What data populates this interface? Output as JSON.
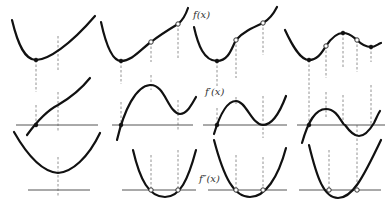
{
  "labels": {
    "f": "f(x)",
    "f1": "f′(x)",
    "f2": "f″(x)"
  },
  "label_positions": {
    "f": {
      "x": 193,
      "y": 18
    },
    "f1": {
      "x": 205,
      "y": 95
    },
    "f2": {
      "x": 199,
      "y": 182
    }
  },
  "colors": {
    "curve": "#111111",
    "axis": "#555555",
    "dash": "#777777"
  },
  "panels": [
    {
      "id": "col1",
      "f": {
        "path": "M12,20 C18,45 25,60 36,60 C48,60 70,45 95,16",
        "points": [
          {
            "x": 36,
            "y": 60,
            "type": "filled"
          }
        ]
      },
      "f1": {
        "axis_y": 125,
        "axis_x1": 16,
        "axis_x2": 98,
        "path": "M27,135 C38,120 48,110 58,105 C70,98 82,88 90,78",
        "points": [
          {
            "x": 36,
            "y": 125,
            "type": "filled"
          }
        ]
      },
      "f2": {
        "axis_y": 190,
        "axis_x1": 28,
        "axis_x2": 90,
        "path": "M14,132 C30,160 45,172 58,173 C72,172 88,158 100,133",
        "points": []
      },
      "dashes": [
        {
          "x": 36,
          "y1": 60,
          "y2": 92
        },
        {
          "x": 36,
          "y1": 105,
          "y2": 125
        },
        {
          "x": 58,
          "y1": 36,
          "y2": 70
        },
        {
          "x": 58,
          "y1": 92,
          "y2": 132
        },
        {
          "x": 58,
          "y1": 157,
          "y2": 196
        }
      ]
    },
    {
      "id": "col2",
      "f": {
        "path": "M101,22 C106,45 112,61 121,61 C132,61 140,50 151,42 C160,35 168,30 178,24 C183,20 186,14 188,8",
        "points": [
          {
            "x": 121,
            "y": 61,
            "type": "filled"
          },
          {
            "x": 151,
            "y": 42,
            "type": "open"
          },
          {
            "x": 178,
            "y": 24,
            "type": "open"
          }
        ]
      },
      "f1": {
        "axis_y": 125,
        "axis_x1": 112,
        "axis_x2": 193,
        "path": "M117,140 C124,110 136,86 150,85 C165,84 168,113 180,114 C187,114 192,104 196,97",
        "points": [
          {
            "x": 121,
            "y": 125,
            "type": "filled"
          }
        ]
      },
      "f2": {
        "axis_y": 190,
        "axis_x1": 122,
        "axis_x2": 196,
        "path": "M133,150 C140,180 149,197 165,197 C180,197 188,180 196,150",
        "points": [
          {
            "x": 151,
            "y": 190,
            "type": "open"
          },
          {
            "x": 178,
            "y": 190,
            "type": "open"
          }
        ]
      },
      "dashes": [
        {
          "x": 121,
          "y1": 61,
          "y2": 84
        },
        {
          "x": 121,
          "y1": 102,
          "y2": 125
        },
        {
          "x": 151,
          "y1": 42,
          "y2": 62
        },
        {
          "x": 151,
          "y1": 75,
          "y2": 90
        },
        {
          "x": 151,
          "y1": 155,
          "y2": 190
        },
        {
          "x": 178,
          "y1": 24,
          "y2": 60
        },
        {
          "x": 178,
          "y1": 100,
          "y2": 130
        },
        {
          "x": 178,
          "y1": 150,
          "y2": 190
        }
      ]
    },
    {
      "id": "col3",
      "f": {
        "path": "M194,27 C198,45 204,61 217,61 C229,61 232,47 236,40 C243,32 252,28 263,23 C270,19 274,13 277,7",
        "points": [
          {
            "x": 217,
            "y": 61,
            "type": "filled"
          },
          {
            "x": 236,
            "y": 40,
            "type": "open"
          },
          {
            "x": 263,
            "y": 23,
            "type": "open"
          }
        ]
      },
      "f1": {
        "axis_y": 125,
        "axis_x1": 203,
        "axis_x2": 287,
        "path": "M214,134 C220,114 227,101 236,101 C246,101 252,125 263,125 C272,125 280,112 286,96",
        "points": [
          {
            "x": 217,
            "y": 125,
            "type": "filled"
          }
        ]
      },
      "f2": {
        "axis_y": 190,
        "axis_x1": 208,
        "axis_x2": 287,
        "path": "M214,140 C224,178 234,197 250,197 C265,197 278,178 286,148",
        "points": [
          {
            "x": 236,
            "y": 190,
            "type": "open"
          },
          {
            "x": 263,
            "y": 190,
            "type": "open"
          }
        ]
      },
      "dashes": [
        {
          "x": 217,
          "y1": 61,
          "y2": 88
        },
        {
          "x": 217,
          "y1": 108,
          "y2": 125
        },
        {
          "x": 236,
          "y1": 40,
          "y2": 78
        },
        {
          "x": 236,
          "y1": 97,
          "y2": 106
        },
        {
          "x": 236,
          "y1": 155,
          "y2": 190
        },
        {
          "x": 263,
          "y1": 23,
          "y2": 55
        },
        {
          "x": 263,
          "y1": 96,
          "y2": 138
        },
        {
          "x": 263,
          "y1": 157,
          "y2": 190
        }
      ]
    },
    {
      "id": "col4",
      "f": {
        "path": "M285,30 C292,45 300,60 309,60 C318,60 322,52 326,46 C332,37 338,33 343,33 C350,33 353,37 357,40 C362,45 368,47 371,47 C375,47 378,44 381,43",
        "points": [
          {
            "x": 309,
            "y": 60,
            "type": "filled"
          },
          {
            "x": 326,
            "y": 46,
            "type": "open"
          },
          {
            "x": 343,
            "y": 33,
            "type": "filled"
          },
          {
            "x": 357,
            "y": 40,
            "type": "open"
          },
          {
            "x": 371,
            "y": 47,
            "type": "filled"
          }
        ]
      },
      "f1": {
        "axis_y": 125,
        "axis_x1": 297,
        "axis_x2": 385,
        "path": "M302,143 C308,122 315,109 326,109 C338,109 342,125 345,125 C350,132 355,136 359,136 C366,136 371,128 374,123 C376,119 378,114 380,111",
        "points": [
          {
            "x": 309,
            "y": 125,
            "type": "filled"
          }
        ]
      },
      "f2": {
        "axis_y": 190,
        "axis_x1": 299,
        "axis_x2": 381,
        "path": "M309,145 C317,178 324,198 338,198 C352,198 362,180 381,140",
        "points": [
          {
            "x": 329,
            "y": 190,
            "type": "open"
          },
          {
            "x": 357,
            "y": 190,
            "type": "open"
          }
        ]
      },
      "dashes": [
        {
          "x": 309,
          "y1": 60,
          "y2": 125
        },
        {
          "x": 326,
          "y1": 46,
          "y2": 78
        },
        {
          "x": 326,
          "y1": 92,
          "y2": 118
        },
        {
          "x": 343,
          "y1": 33,
          "y2": 68
        },
        {
          "x": 343,
          "y1": 95,
          "y2": 125
        },
        {
          "x": 357,
          "y1": 40,
          "y2": 72
        },
        {
          "x": 357,
          "y1": 125,
          "y2": 145
        },
        {
          "x": 371,
          "y1": 47,
          "y2": 62
        },
        {
          "x": 371,
          "y1": 85,
          "y2": 125
        },
        {
          "x": 329,
          "y1": 150,
          "y2": 190
        },
        {
          "x": 357,
          "y1": 148,
          "y2": 190
        }
      ]
    }
  ]
}
